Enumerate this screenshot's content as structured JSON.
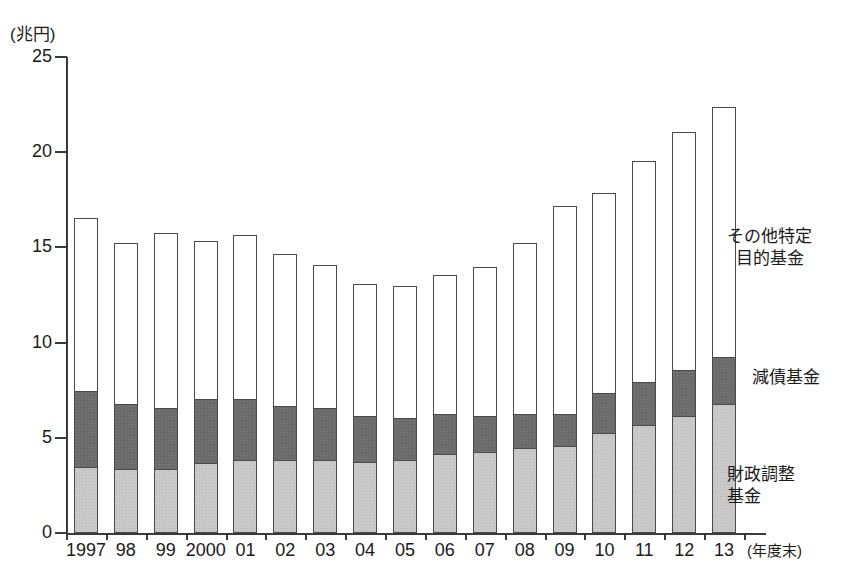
{
  "chart_data": {
    "type": "bar",
    "subtype": "stacked-vertical",
    "title": "",
    "unit_label": "(兆円)",
    "xlabel": "(年度末)",
    "ylabel": "",
    "ylim": [
      0,
      25
    ],
    "yticks": [
      0,
      5,
      10,
      15,
      20,
      25
    ],
    "grid": false,
    "legend_position": "right-inside",
    "categories": [
      "1997",
      "98",
      "99",
      "2000",
      "01",
      "02",
      "03",
      "04",
      "05",
      "06",
      "07",
      "08",
      "09",
      "10",
      "11",
      "12",
      "13"
    ],
    "series": [
      {
        "name": "財政調整基金",
        "color": "#c9c9c9",
        "values": [
          3.4,
          3.3,
          3.3,
          3.6,
          3.8,
          3.8,
          3.8,
          3.7,
          3.8,
          4.1,
          4.2,
          4.4,
          4.5,
          5.2,
          5.6,
          6.1,
          6.7
        ]
      },
      {
        "name": "減債基金",
        "color": "#6b6b6b",
        "values": [
          4.0,
          3.4,
          3.2,
          3.4,
          3.2,
          2.8,
          2.7,
          2.4,
          2.2,
          2.1,
          1.9,
          1.8,
          1.7,
          2.1,
          2.3,
          2.4,
          2.5
        ]
      },
      {
        "name": "その他特定目的基金",
        "color": "#ffffff",
        "values": [
          9.1,
          8.5,
          9.2,
          8.3,
          8.6,
          8.0,
          7.5,
          6.9,
          6.9,
          7.3,
          7.8,
          9.0,
          10.9,
          10.5,
          11.6,
          12.5,
          13.1
        ]
      }
    ],
    "totals": [
      16.5,
      15.2,
      15.7,
      15.3,
      15.6,
      14.6,
      14.0,
      13.0,
      12.9,
      13.5,
      13.9,
      15.2,
      17.1,
      17.8,
      19.5,
      21.0,
      22.3
    ]
  },
  "legend": {
    "other": "その他特定\n目的基金",
    "other_line1": "その他特定",
    "other_line2": "目的基金",
    "debt": "減債基金",
    "fiscal_line1": "財政調整",
    "fiscal_line2": "基金"
  },
  "axis": {
    "unit": "(兆円)",
    "x_unit": "(年度末)",
    "y_tick_labels": [
      "25",
      "20",
      "15",
      "10",
      "5",
      "0"
    ],
    "x_tick_labels": [
      "1997",
      "98",
      "99",
      "2000",
      "01",
      "02",
      "03",
      "04",
      "05",
      "06",
      "07",
      "08",
      "09",
      "10",
      "11",
      "12",
      "13"
    ]
  }
}
